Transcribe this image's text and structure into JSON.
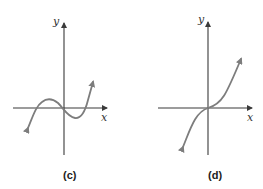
{
  "panels": [
    {
      "id": "c",
      "caption": "(c)",
      "x_label": "x",
      "y_label": "y",
      "curve": "cubic with local max and local min, three x-intercepts",
      "colors": {
        "axis": "#3a3a3a",
        "curve": "#7d7d7d"
      }
    },
    {
      "id": "d",
      "caption": "(d)",
      "x_label": "x",
      "y_label": "y",
      "curve": "increasing cubic through origin with inflection point at origin",
      "colors": {
        "axis": "#3a3a3a",
        "curve": "#7d7d7d"
      }
    }
  ]
}
